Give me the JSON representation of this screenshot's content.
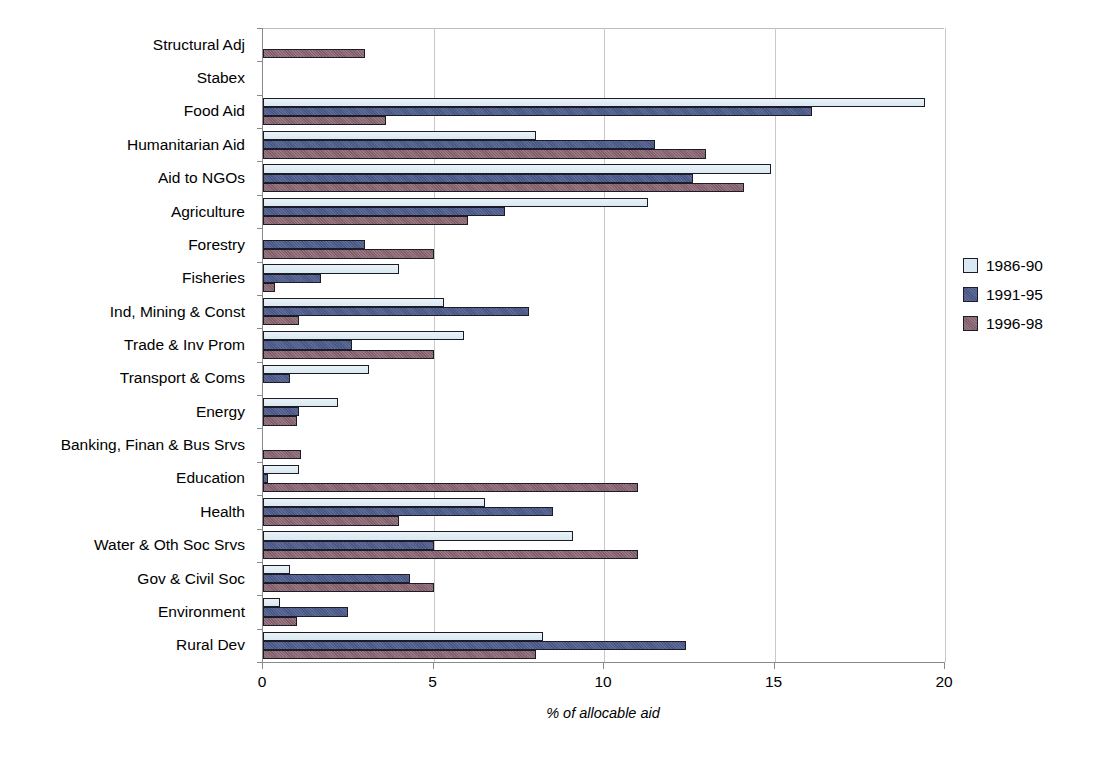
{
  "chart_data": {
    "type": "bar",
    "orientation": "horizontal",
    "title": "",
    "xlabel": "% of allocable aid",
    "ylabel": "",
    "xlim": [
      0,
      20
    ],
    "xticks": [
      0,
      5,
      10,
      15,
      20
    ],
    "xtick_labels": [
      "0",
      "5",
      "10",
      "15",
      "20"
    ],
    "grid": "vertical",
    "legend_position": "right",
    "categories": [
      "Structural Adj",
      "Stabex",
      "Food Aid",
      "Humanitarian Aid",
      "Aid to NGOs",
      "Agriculture",
      "Forestry",
      "Fisheries",
      "Ind, Mining & Const",
      "Trade & Inv Prom",
      "Transport & Coms",
      "Energy",
      "Banking, Finan & Bus Srvs",
      "Education",
      "Health",
      "Water & Oth Soc Srvs",
      "Gov & Civil Soc",
      "Environment",
      "Rural Dev"
    ],
    "series": [
      {
        "name": "1986-90",
        "color": "#d9e8f1",
        "values": [
          0,
          0,
          19.4,
          8.0,
          14.9,
          11.3,
          0,
          4.0,
          5.3,
          5.9,
          3.1,
          2.2,
          0,
          1.05,
          6.5,
          9.1,
          0.8,
          0.5,
          8.2
        ]
      },
      {
        "name": "1991-95",
        "color": "#4c5b8b",
        "values": [
          0,
          0,
          16.1,
          11.5,
          12.6,
          7.1,
          3.0,
          1.7,
          7.8,
          2.6,
          0.8,
          1.05,
          0,
          0.15,
          8.5,
          5.0,
          4.3,
          2.5,
          12.4
        ]
      },
      {
        "name": "1996-98",
        "color": "#8a6571",
        "values": [
          3.0,
          0,
          3.6,
          13.0,
          14.1,
          6.0,
          5.0,
          0.35,
          1.05,
          5.0,
          0,
          1.0,
          1.1,
          11.0,
          4.0,
          11.0,
          5.0,
          1.0,
          8.0
        ]
      }
    ]
  },
  "legend": {
    "items": [
      {
        "label": "1986-90"
      },
      {
        "label": "1991-95"
      },
      {
        "label": "1996-98"
      }
    ]
  }
}
